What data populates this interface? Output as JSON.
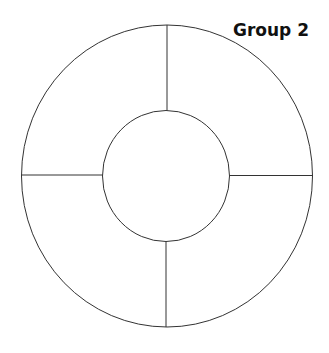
{
  "diagram": {
    "title": "Group 2",
    "stroke_color": "#333333",
    "background": "#ffffff",
    "outer_ring": {
      "cx": 167,
      "cy": 176,
      "rx": 145.5,
      "ry": 151
    },
    "inner_circle": {
      "cx": 166,
      "cy": 176,
      "rx": 63.5,
      "ry": 65.5
    },
    "segments": 4,
    "dividers": [
      "top",
      "right",
      "bottom",
      "left"
    ]
  }
}
